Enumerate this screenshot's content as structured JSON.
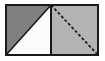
{
  "figure": {
    "canvas": {
      "width": 105,
      "height": 61
    },
    "colors": {
      "background": "#ffffff",
      "outline": "#1a1a1a",
      "dark_fill": "#808080",
      "light_fill": "#fbfbfb",
      "medium_fill": "#b3b3b3",
      "dash_stroke": "#1f1f1f"
    },
    "geometry": {
      "outer_rect": {
        "x": 6,
        "y": 5,
        "width": 92,
        "height": 50
      },
      "divider_x": 51,
      "left_square": {
        "x": 6,
        "y": 5,
        "width": 45,
        "height": 50
      },
      "right_square": {
        "x": 51,
        "y": 5,
        "width": 47,
        "height": 50
      },
      "left_diagonal": {
        "x1": 51,
        "y1": 5,
        "x2": 6,
        "y2": 55,
        "style": "solid"
      },
      "right_diagonal": {
        "x1": 51,
        "y1": 5,
        "x2": 98,
        "y2": 55,
        "style": "dashed"
      },
      "outline_width": 2,
      "divider_width": 2,
      "dash_pattern": "3 2"
    },
    "parts": [
      {
        "name": "left-upper-triangle",
        "fill": "dark_fill",
        "label": ""
      },
      {
        "name": "left-lower-triangle",
        "fill": "light_fill",
        "label": ""
      },
      {
        "name": "right-square-fill",
        "fill": "medium_fill",
        "label": ""
      }
    ]
  }
}
